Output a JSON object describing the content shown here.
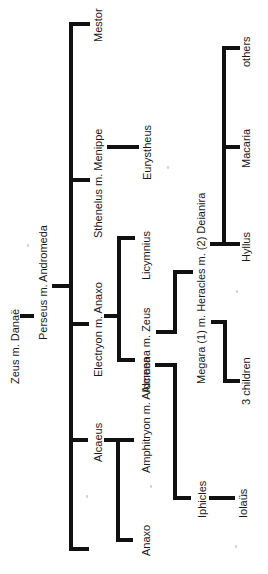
{
  "diagram": {
    "type": "family-tree",
    "orientation": "rotated-90-ccw",
    "line_color": "#111111",
    "text_color": "#1a1a1a",
    "nodes": {
      "zeus_danae": "Zeus m. Danaë",
      "perseus": "Perseus m. Andromeda",
      "mestor": "Mestor",
      "sthenelus": "Sthenelus m. Menippe",
      "eurystheus": "Eurystheus",
      "electryon": "Electryon m. Anaxo",
      "licymnius": "Licymnius",
      "alcmena_zeus": "Alcmena m. Zeus",
      "heracles": "Megara (1) m. Heracles m. (2) Deianira",
      "hyllus": "Hyllus",
      "macaria": "Macaria",
      "others": "others",
      "three_children": "3 children",
      "alcaeus": "Alcaeus",
      "amphitryon": "Amphitryon m. Alcmena",
      "anaxo": "Anaxo",
      "iphicles": "Iphicles",
      "iolaus": "Iolaüs",
      "perses": "Perses"
    },
    "edges": [
      [
        "zeus_danae",
        "perseus"
      ],
      [
        "perseus",
        "mestor"
      ],
      [
        "perseus",
        "sthenelus"
      ],
      [
        "perseus",
        "electryon"
      ],
      [
        "perseus",
        "alcaeus"
      ],
      [
        "perseus",
        "perses"
      ],
      [
        "sthenelus",
        "eurystheus"
      ],
      [
        "electryon",
        "licymnius"
      ],
      [
        "electryon",
        "alcmena_zeus"
      ],
      [
        "alcmena_zeus",
        "heracles"
      ],
      [
        "amphitryon",
        "heracles"
      ],
      [
        "heracles",
        "hyllus"
      ],
      [
        "heracles",
        "macaria"
      ],
      [
        "heracles",
        "others"
      ],
      [
        "heracles",
        "three_children"
      ],
      [
        "alcaeus",
        "amphitryon"
      ],
      [
        "alcaeus",
        "anaxo"
      ],
      [
        "amphitryon",
        "iphicles"
      ],
      [
        "iphicles",
        "iolaus"
      ]
    ]
  }
}
